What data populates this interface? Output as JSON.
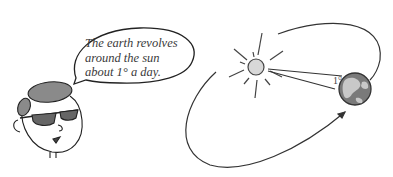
{
  "speech_bubble": {
    "lines": [
      "The earth revolves",
      "around the sun",
      "about 1° a day."
    ]
  },
  "diagram": {
    "angle_label": "1°",
    "sun_color": "#d8d8d8",
    "earth_ocean_color": "#7a7a7a",
    "earth_land_color": "#c8c8c8",
    "stroke_color": "#333333"
  }
}
